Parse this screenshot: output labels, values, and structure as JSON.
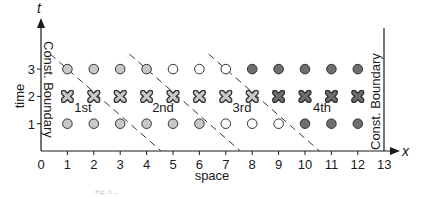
{
  "figure": {
    "axes": {
      "x_var": "x",
      "t_var": "t",
      "x_title": "space",
      "t_title": "time",
      "x_ticks": [
        "0",
        "1",
        "2",
        "3",
        "4",
        "5",
        "6",
        "7",
        "8",
        "9",
        "10",
        "11",
        "12",
        "13"
      ],
      "t_ticks": [
        "1",
        "2",
        "3"
      ]
    },
    "boundaries": {
      "left": "Const. Boundary",
      "right": "Const. Boundary"
    },
    "stages": [
      {
        "label": "1st"
      },
      {
        "label": "2nd"
      },
      {
        "label": "3rd"
      },
      {
        "label": "4th"
      }
    ],
    "colors": {
      "ink": "#1a1a1a",
      "light_gray_fill": "#c8c8c8",
      "dark_gray_fill": "#6e6e6e",
      "white_fill": "#ffffff",
      "dashed_line": "#333333"
    },
    "caption": "Fig. 3 ..."
  },
  "chart_data": {
    "type": "scatter",
    "title": "",
    "xlabel": "space",
    "ylabel": "time",
    "xlim": [
      0,
      13
    ],
    "ylim": [
      0,
      3.5
    ],
    "x_ticks": [
      0,
      1,
      2,
      3,
      4,
      5,
      6,
      7,
      8,
      9,
      10,
      11,
      12,
      13
    ],
    "y_ticks": [
      1,
      2,
      3
    ],
    "series": [
      {
        "name": "t=3 circles",
        "t": 3,
        "x": [
          1,
          2,
          3,
          4,
          5,
          6,
          7,
          8,
          9,
          10,
          11,
          12
        ],
        "fill": [
          "light",
          "light",
          "light",
          "light",
          "white",
          "white",
          "white",
          "dark",
          "dark",
          "dark",
          "dark",
          "dark"
        ]
      },
      {
        "name": "t=2 crosses",
        "t": 2,
        "x": [
          1,
          2,
          3,
          4,
          5,
          6,
          7,
          8,
          9,
          10,
          11,
          12
        ],
        "fill": [
          "light",
          "light",
          "light",
          "light",
          "light",
          "light",
          "light",
          "light",
          "dark",
          "dark",
          "dark",
          "dark"
        ]
      },
      {
        "name": "t=1 circles",
        "t": 1,
        "x": [
          1,
          2,
          3,
          4,
          5,
          6,
          7,
          8,
          9,
          10,
          11,
          12
        ],
        "fill": [
          "light",
          "light",
          "light",
          "light",
          "light",
          "light",
          "white",
          "white",
          "white",
          "dark",
          "dark",
          "dark"
        ]
      }
    ],
    "dashed_lines": [
      {
        "from": [
          0.35,
          3.55
        ],
        "to": [
          4.55,
          0
        ]
      },
      {
        "from": [
          3.35,
          3.55
        ],
        "to": [
          7.55,
          0
        ]
      },
      {
        "from": [
          6.35,
          3.55
        ],
        "to": [
          10.55,
          0
        ]
      }
    ],
    "annotations": [
      {
        "text": "1st",
        "x": 1.5,
        "t": 1.6
      },
      {
        "text": "2nd",
        "x": 4.5,
        "t": 1.6
      },
      {
        "text": "3rd",
        "x": 7.5,
        "t": 1.6
      },
      {
        "text": "4th",
        "x": 10.5,
        "t": 1.6
      },
      {
        "text": "Const. Boundary",
        "x": 0,
        "orientation": "vertical"
      },
      {
        "text": "Const. Boundary",
        "x": 13,
        "orientation": "vertical"
      }
    ],
    "grid": false,
    "legend": "none"
  }
}
